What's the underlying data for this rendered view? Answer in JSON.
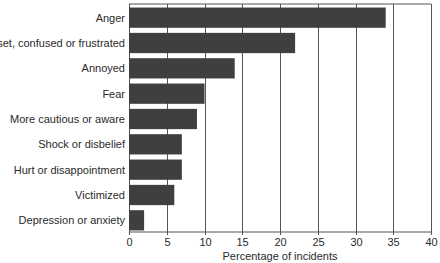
{
  "chart_data": {
    "type": "bar",
    "orientation": "horizontal",
    "title": "",
    "xlabel": "Percentage of incidents",
    "ylabel": "",
    "categories": [
      "Anger",
      "Upset, confused or frustrated",
      "Annoyed",
      "Fear",
      "More cautious or aware",
      "Shock or disbelief",
      "Hurt or disappointment",
      "Victimized",
      "Depression or anxiety"
    ],
    "values": [
      34,
      22,
      14,
      10,
      9,
      7,
      7,
      6,
      2
    ],
    "xlim": [
      0,
      40
    ],
    "xticks": [
      0,
      5,
      10,
      15,
      20,
      25,
      30,
      35,
      40
    ],
    "grid": "vertical",
    "legend": "none",
    "colors": {
      "bar": "#3f3f3f",
      "grid": "#555555",
      "text": "#2a2a2a"
    }
  }
}
